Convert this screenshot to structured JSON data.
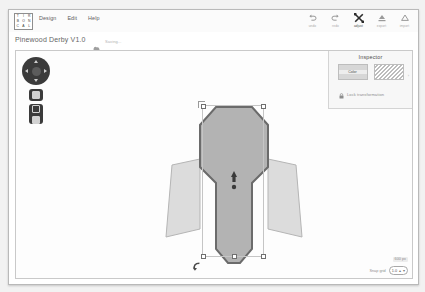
{
  "app": {
    "logo_letters": [
      "T",
      "I",
      "R",
      "B",
      "O",
      "N",
      "C",
      "A",
      "L"
    ],
    "menus": [
      "Design",
      "Edit",
      "Help"
    ],
    "toolbar": [
      {
        "label": "undo",
        "icon": "undo-arrow-icon",
        "active": false
      },
      {
        "label": "redo",
        "icon": "redo-arrow-icon",
        "active": false
      },
      {
        "label": "adjust",
        "icon": "transform-icon",
        "active": true
      },
      {
        "label": "export",
        "icon": "export-icon",
        "active": false
      },
      {
        "label": "import",
        "icon": "import-icon",
        "active": false
      }
    ]
  },
  "document": {
    "title": "Pinewood Derby V1.0",
    "cloud_icon": "cloud-sync-icon",
    "save_state": "Saving..."
  },
  "nav": {
    "pad_icon": "pan-navigation-pad",
    "buttons": [
      {
        "name": "zoom-tool",
        "icon": "square-icon"
      },
      {
        "name": "layers-tool",
        "icon": "stacked-squares-icon"
      }
    ]
  },
  "inspector": {
    "title": "Inspector",
    "swatches": [
      {
        "name": "color-swatch",
        "label": "Color",
        "fill": "#d7d7d7"
      },
      {
        "name": "pattern-swatch",
        "label": "",
        "fill": "hatch"
      }
    ],
    "more_glyph": "›",
    "lock": {
      "icon": "lock-icon",
      "label": "Lock transformation"
    }
  },
  "canvas": {
    "shape_name": "pinewood-derby-car-body",
    "body_fill": "#b3b3b3",
    "body_stroke": "#6b6b6b",
    "fin_fill": "#dcdcdc",
    "fin_stroke": "#b5b5b5",
    "rotate_handle_icon": "rotate-handle-icon",
    "center_marker_icon": "center-origin-icon"
  },
  "footer": {
    "dimension": "600 px",
    "grid_label": "Snap grid",
    "grid_value": "1.0",
    "stepper_up": "▴",
    "stepper_down": "▾"
  },
  "colors": {
    "panel": "#f7f7f7",
    "accent": "#3b3b3b",
    "border": "#c9c9c9"
  }
}
